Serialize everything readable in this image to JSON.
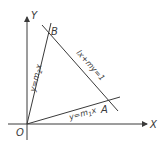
{
  "diagram": {
    "axes": {
      "x_label": "X",
      "y_label": "Y",
      "origin_label": "O"
    },
    "points": {
      "A": "A",
      "B": "B"
    },
    "lines": {
      "line_oa": {
        "prefix": "y=m",
        "sub": "1",
        "suffix": "x"
      },
      "line_ob": {
        "prefix": "y=m",
        "sub": "2",
        "suffix": "x"
      },
      "line_ab": {
        "label": "lx+my=1"
      }
    },
    "colors": {
      "stroke": "#3a3a3a",
      "background": "#ffffff"
    }
  }
}
